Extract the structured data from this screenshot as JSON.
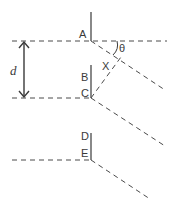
{
  "diagram": {
    "title": "",
    "labels": {
      "A": "A",
      "B": "B",
      "C": "C",
      "D": "D",
      "E": "E",
      "X": "X",
      "theta": "θ",
      "d": "d"
    },
    "colors": {
      "line": "#3a3a3a",
      "dashed": "#4a4a4a",
      "background": "#ffffff"
    },
    "elements": [
      {
        "id": "wavefront-dashed-line-1",
        "type": "dashed",
        "desc": "horizontal dashed line through A"
      },
      {
        "id": "wavefront-dashed-line-2",
        "type": "dashed",
        "desc": "horizontal dashed line ending at C"
      },
      {
        "id": "wavefront-dashed-line-3",
        "type": "dashed",
        "desc": "horizontal dashed line ending at E"
      },
      {
        "id": "diffracted-ray-from-A",
        "type": "dashed",
        "desc": "ray at angle theta from A"
      },
      {
        "id": "diffracted-ray-from-C",
        "type": "dashed",
        "desc": "ray at angle theta from C"
      },
      {
        "id": "diffracted-ray-from-E",
        "type": "dashed",
        "desc": "ray at angle theta from E"
      },
      {
        "id": "perpendicular-from-C",
        "type": "dashed",
        "desc": "perpendicular from C to ray through X"
      },
      {
        "id": "separation-arrow-d",
        "type": "double-arrow",
        "desc": "distance d between lines"
      }
    ]
  }
}
